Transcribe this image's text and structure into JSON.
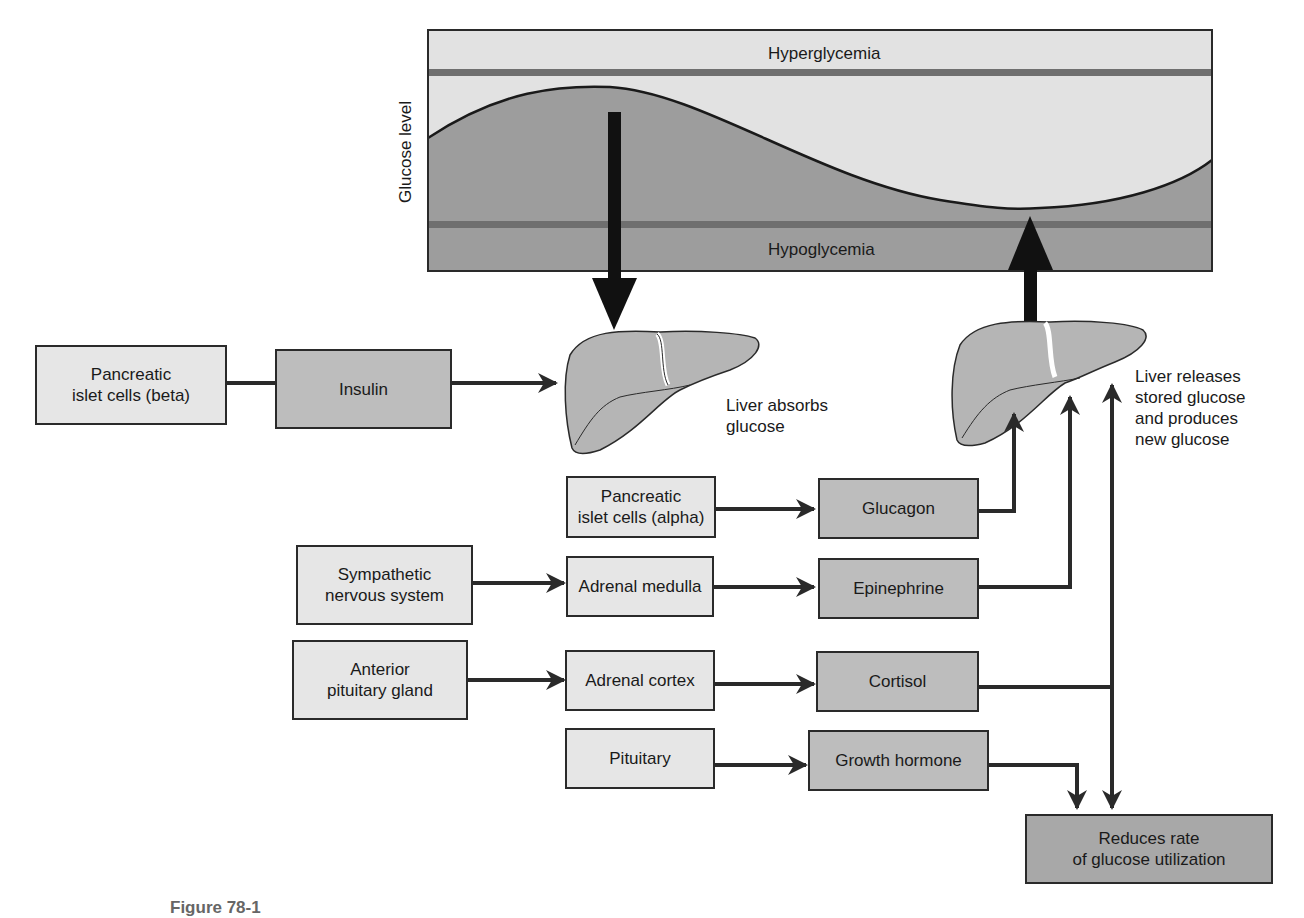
{
  "chart_panel": {
    "y_axis_label": "Glucose level",
    "upper_zone_label": "Hyperglycemia",
    "lower_zone_label": "Hypoglycemia"
  },
  "liver_labels": {
    "absorbs": [
      "Liver absorbs",
      "glucose"
    ],
    "releases": [
      "Liver releases",
      "stored glucose",
      "and produces",
      "new glucose"
    ]
  },
  "boxes": {
    "beta_cells": [
      "Pancreatic",
      "islet cells (beta)"
    ],
    "insulin": "Insulin",
    "alpha_cells": [
      "Pancreatic",
      "islet cells (alpha)"
    ],
    "glucagon": "Glucagon",
    "sympathetic": [
      "Sympathetic",
      "nervous system"
    ],
    "adrenal_medulla": "Adrenal medulla",
    "epinephrine": "Epinephrine",
    "anterior_pituitary": [
      "Anterior",
      "pituitary gland"
    ],
    "adrenal_cortex": "Adrenal cortex",
    "cortisol": "Cortisol",
    "pituitary": "Pituitary",
    "growth_hormone": "Growth hormone",
    "reduces_rate": [
      "Reduces rate",
      "of glucose utilization"
    ]
  },
  "caption": "Figure 78-1",
  "colors": {
    "light_fill": "#e6e6e6",
    "mid_fill": "#bdbdbd",
    "dark_fill": "#a8a8a8",
    "line": "#2a2a2a"
  }
}
